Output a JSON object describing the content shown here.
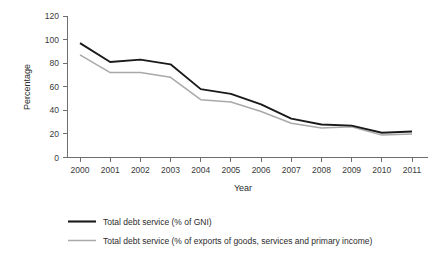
{
  "chart_data": {
    "type": "line",
    "title": "",
    "xlabel": "Year",
    "ylabel": "Percentage",
    "categories": [
      "2000",
      "2001",
      "2002",
      "2003",
      "2004",
      "2005",
      "2006",
      "2007",
      "2008",
      "2009",
      "2010",
      "2011"
    ],
    "x": [
      2000,
      2001,
      2002,
      2003,
      2004,
      2005,
      2006,
      2007,
      2008,
      2009,
      2010,
      2011
    ],
    "ylim": [
      0,
      120
    ],
    "yticks": [
      0,
      20,
      40,
      60,
      80,
      100,
      120
    ],
    "ytick_labels": [
      "0",
      "20",
      "40",
      "60",
      "80",
      "100",
      "120"
    ],
    "grid": false,
    "legend_position": "bottom-left",
    "series": [
      {
        "name": "Total debt service (% of GNI)",
        "color": "#1a1a1a",
        "values": [
          97,
          81,
          83,
          79,
          58,
          54,
          45,
          33,
          28,
          27,
          21,
          22
        ]
      },
      {
        "name": "Total debt service (% of exports of goods, services and primary income)",
        "color": "#a9a9a9",
        "values": [
          87,
          72,
          72,
          68,
          49,
          47,
          39,
          29,
          25,
          26,
          19,
          20
        ]
      }
    ]
  },
  "axes": {
    "y_title": "Percentage",
    "x_title": "Year"
  },
  "legend": {
    "items": [
      {
        "label": "Total debt service (% of GNI)",
        "color": "#1a1a1a"
      },
      {
        "label": "Total debt service (% of exports of goods, services and primary income)",
        "color": "#a9a9a9"
      }
    ]
  },
  "colors": {
    "primary_series": "#1a1a1a",
    "secondary_series": "#a9a9a9",
    "axis": "#6f6f6f",
    "text": "#2b2b2b",
    "background": "#ffffff"
  }
}
